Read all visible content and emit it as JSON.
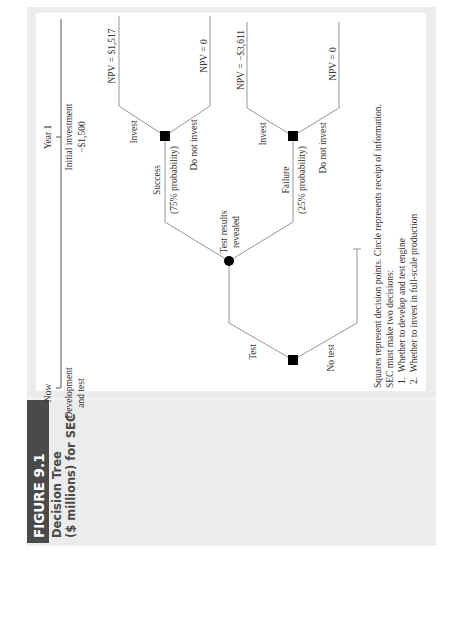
{
  "figure": {
    "number_label": "FIGURE 9.1",
    "title_line1": "Decision Tree",
    "title_line2": "($ millions) for SEC",
    "orientation": "rotated 90° counter-clockwise",
    "colors": {
      "outer_panel": "#ececec",
      "inner_panel": "#ffffff",
      "label_bar": "#4a4a4a",
      "label_text": "#ffffff",
      "title_text": "#4a4a4a",
      "node_fill": "#000000",
      "edge": "#8a8a8a"
    }
  },
  "timeline": {
    "now_label": "Now",
    "year1_label": "Year 1",
    "now_event_line1": "Development",
    "now_event_line2": "and test",
    "year1_event_line1": "Initial investment",
    "year1_event_line2": "−$1,500"
  },
  "tree": {
    "root": {
      "type": "decision",
      "branches": {
        "test": "Test",
        "no_test": "No test"
      }
    },
    "chance_node": {
      "type": "chance",
      "label_line1": "Test results",
      "label_line2": "revealed",
      "success": {
        "label": "Success",
        "probability": "(75% probability)"
      },
      "failure": {
        "label": "Failure",
        "probability": "(25% probability)"
      }
    },
    "success_decision": {
      "type": "decision",
      "invest_label": "Invest",
      "do_not_invest_label": "Do not invest",
      "invest_npv": "NPV = $1,517",
      "do_not_invest_npv": "NPV = 0"
    },
    "failure_decision": {
      "type": "decision",
      "invest_label": "Invest",
      "do_not_invest_label": "Do not invest",
      "invest_npv": "NPV = −$3,611",
      "do_not_invest_npv": "NPV = 0"
    }
  },
  "notes": {
    "line1": "Squares represent decision points. Circle represents receipt of information.",
    "line2": "SEC must make two decisions:",
    "item1": "1.  Whether to develop and test engine",
    "item2": "2.  Whether to invest in full-scale production"
  }
}
